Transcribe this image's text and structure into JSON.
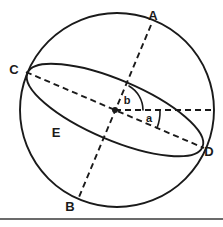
{
  "figure": {
    "background_color": "#ffffff",
    "line_color": "#1a1a1a",
    "width": 223,
    "height": 227
  },
  "geometry": {
    "sphere": {
      "cx": 117,
      "cy": 110,
      "r": 97
    },
    "ellipse": {
      "cx": 115,
      "cy": 110,
      "rx": 95,
      "ry": 30,
      "rotation_deg": 23
    },
    "center_point": {
      "x": 115,
      "y": 110
    },
    "axis_ab": {
      "x1": 151,
      "y1": 25,
      "x2": 79,
      "y2": 197
    },
    "axis_cd": {
      "x1": 26,
      "y1": 72,
      "x2": 204,
      "y2": 148
    },
    "horizontal_ray": {
      "x1": 115,
      "y1": 110,
      "x2": 214,
      "y2": 110
    },
    "baseline_rule": {
      "x1": 0,
      "y1": 219,
      "x2": 223,
      "y2": 219
    }
  },
  "labels": {
    "points": [
      {
        "id": "A",
        "text": "A",
        "x": 153,
        "y": 17
      },
      {
        "id": "B",
        "text": "B",
        "x": 70,
        "y": 208
      },
      {
        "id": "C",
        "text": "C",
        "x": 14,
        "y": 71
      },
      {
        "id": "D",
        "text": "D",
        "x": 209,
        "y": 153
      },
      {
        "id": "E",
        "text": "E",
        "x": 56,
        "y": 134
      }
    ],
    "angles": [
      {
        "id": "b",
        "text": "b",
        "x": 127,
        "y": 101,
        "description": "angle between polar axis A and horizontal reference line"
      },
      {
        "id": "a",
        "text": "a",
        "x": 149,
        "y": 119,
        "description": "angle between horizontal reference line and the inclined plane line C-D"
      }
    ]
  },
  "icons": {
    "vertex_marker": "center-dot"
  }
}
